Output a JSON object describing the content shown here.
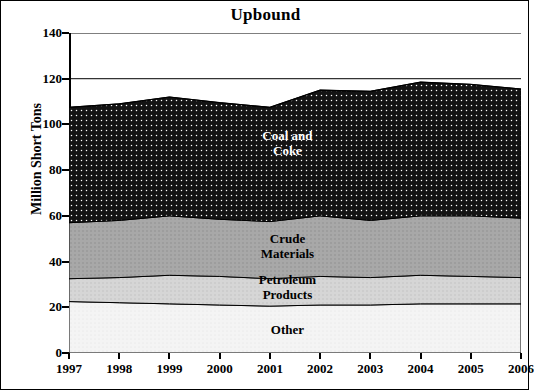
{
  "chart_data": {
    "type": "area",
    "title": "Upbound",
    "xlabel": "",
    "ylabel": "Million Short Tons",
    "x": [
      1997,
      1998,
      1999,
      2000,
      2001,
      2002,
      2003,
      2004,
      2005,
      2006
    ],
    "xtick_labels": [
      "1997",
      "1998",
      "1999",
      "2000",
      "2001",
      "2002",
      "2003",
      "2004",
      "2005",
      "2006"
    ],
    "ytick_labels": [
      "0",
      "20",
      "40",
      "60",
      "80",
      "100",
      "120",
      "140"
    ],
    "ylim": [
      0,
      140
    ],
    "ytick_step": 20,
    "grid": false,
    "stacked": true,
    "legend_position": "inline-labels",
    "series": [
      {
        "name": "Other",
        "label": "Other",
        "color": "#f2f2f2",
        "values": [
          22.5,
          22.0,
          21.5,
          21.0,
          20.5,
          21.0,
          21.0,
          21.5,
          21.5,
          21.5
        ]
      },
      {
        "name": "Petroleum Products",
        "label": "Petroleum\nProducts",
        "color": "#d4d4d4",
        "values": [
          10.0,
          11.0,
          12.5,
          12.5,
          12.0,
          12.5,
          12.0,
          12.5,
          12.0,
          11.5
        ]
      },
      {
        "name": "Crude Materials",
        "label": "Crude\nMaterials",
        "color": "#a8a8a8",
        "values": [
          24.5,
          25.0,
          26.0,
          25.0,
          25.0,
          26.5,
          25.0,
          26.0,
          26.5,
          26.0
        ]
      },
      {
        "name": "Coal and Coke",
        "label": "Coal and\nCoke",
        "color": "#1a1a1a",
        "values": [
          50.5,
          51.0,
          52.0,
          51.0,
          50.0,
          55.0,
          56.5,
          58.5,
          57.5,
          56.5
        ]
      }
    ],
    "series_totals": [
      107.5,
      109.0,
      112.0,
      109.5,
      107.5,
      115.0,
      114.5,
      118.5,
      117.5,
      115.5
    ],
    "annotations": [
      {
        "text": "Coal and\nCoke",
        "x": 2001.35,
        "y": 92,
        "style": "on-dark"
      },
      {
        "text": "Crude\nMaterials",
        "x": 2001.35,
        "y": 47,
        "style": "on-light"
      },
      {
        "text": "Petroleum\nProducts",
        "x": 2001.35,
        "y": 29,
        "style": "on-light"
      },
      {
        "text": "Other",
        "x": 2001.35,
        "y": 10,
        "style": "on-light"
      }
    ]
  }
}
